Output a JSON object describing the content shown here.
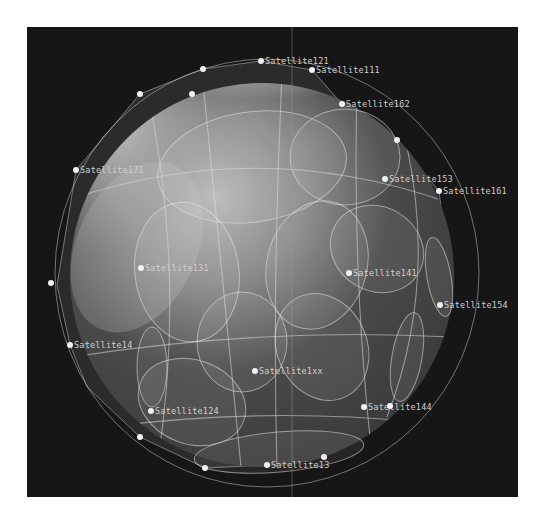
{
  "view": {
    "background": "#161616",
    "globe_center": [
      235,
      248
    ],
    "globe_radius": 192
  },
  "satellites": [
    {
      "id": "sat-121",
      "label": "Satellite121",
      "x": 234,
      "y": 34,
      "show_label": true
    },
    {
      "id": "sat-111",
      "label": "Satellite111",
      "x": 285,
      "y": 43,
      "show_label": true
    },
    {
      "id": "sat-162",
      "label": "Satellite162",
      "x": 315,
      "y": 77,
      "show_label": true
    },
    {
      "id": "sat-153",
      "label": "Satellite153",
      "x": 358,
      "y": 152,
      "show_label": true
    },
    {
      "id": "sat-161",
      "label": "Satellite161",
      "x": 412,
      "y": 164,
      "show_label": true
    },
    {
      "id": "sat-171",
      "label": "Satellite171",
      "x": 49,
      "y": 143,
      "show_label": true
    },
    {
      "id": "sat-131",
      "label": "Satellite131",
      "x": 114,
      "y": 241,
      "show_label": true
    },
    {
      "id": "sat-141",
      "label": "Satellite141",
      "x": 322,
      "y": 246,
      "show_label": true
    },
    {
      "id": "sat-154",
      "label": "Satellite154",
      "x": 413,
      "y": 278,
      "show_label": true
    },
    {
      "id": "sat-14",
      "label": "Satellite14",
      "x": 43,
      "y": 318,
      "show_label": true
    },
    {
      "id": "sat-mid",
      "label": "Satellite1xx",
      "x": 228,
      "y": 344,
      "show_label": true
    },
    {
      "id": "sat-124",
      "label": "Satellite124",
      "x": 124,
      "y": 384,
      "show_label": true
    },
    {
      "id": "sat-144",
      "label": "Satellite144",
      "x": 337,
      "y": 380,
      "show_label": true
    },
    {
      "id": "sat-13",
      "label": "Satellite13",
      "x": 240,
      "y": 438,
      "show_label": true
    },
    {
      "id": "sat-a",
      "label": "",
      "x": 176,
      "y": 42,
      "show_label": false
    },
    {
      "id": "sat-b",
      "label": "",
      "x": 113,
      "y": 67,
      "show_label": false
    },
    {
      "id": "sat-c",
      "label": "",
      "x": 165,
      "y": 67,
      "show_label": false
    },
    {
      "id": "sat-d",
      "label": "",
      "x": 370,
      "y": 113,
      "show_label": false
    },
    {
      "id": "sat-e",
      "label": "",
      "x": 24,
      "y": 256,
      "show_label": false
    },
    {
      "id": "sat-f",
      "label": "",
      "x": 113,
      "y": 410,
      "show_label": false
    },
    {
      "id": "sat-g",
      "label": "",
      "x": 178,
      "y": 441,
      "show_label": false
    },
    {
      "id": "sat-h",
      "label": "",
      "x": 297,
      "y": 430,
      "show_label": false
    },
    {
      "id": "sat-i",
      "label": "",
      "x": 363,
      "y": 379,
      "show_label": false
    }
  ],
  "coverage_ellipses": [
    {
      "cx": 225,
      "cy": 140,
      "rx": 95,
      "ry": 55,
      "rot": -8
    },
    {
      "cx": 318,
      "cy": 130,
      "rx": 55,
      "ry": 48,
      "rot": 0
    },
    {
      "cx": 160,
      "cy": 245,
      "rx": 52,
      "ry": 70,
      "rot": -8
    },
    {
      "cx": 290,
      "cy": 238,
      "rx": 50,
      "ry": 65,
      "rot": 15
    },
    {
      "cx": 350,
      "cy": 222,
      "rx": 48,
      "ry": 42,
      "rot": 30
    },
    {
      "cx": 215,
      "cy": 315,
      "rx": 45,
      "ry": 50,
      "rot": 0
    },
    {
      "cx": 295,
      "cy": 320,
      "rx": 45,
      "ry": 55,
      "rot": -25
    },
    {
      "cx": 165,
      "cy": 375,
      "rx": 55,
      "ry": 42,
      "rot": 20
    },
    {
      "cx": 125,
      "cy": 340,
      "rx": 15,
      "ry": 40,
      "rot": 0
    },
    {
      "cx": 380,
      "cy": 330,
      "rx": 15,
      "ry": 45,
      "rot": 10
    },
    {
      "cx": 252,
      "cy": 425,
      "rx": 85,
      "ry": 20,
      "rot": -5
    },
    {
      "cx": 412,
      "cy": 250,
      "rx": 12,
      "ry": 40,
      "rot": -10
    }
  ],
  "overlay": {
    "cursor_line_x": 265
  }
}
